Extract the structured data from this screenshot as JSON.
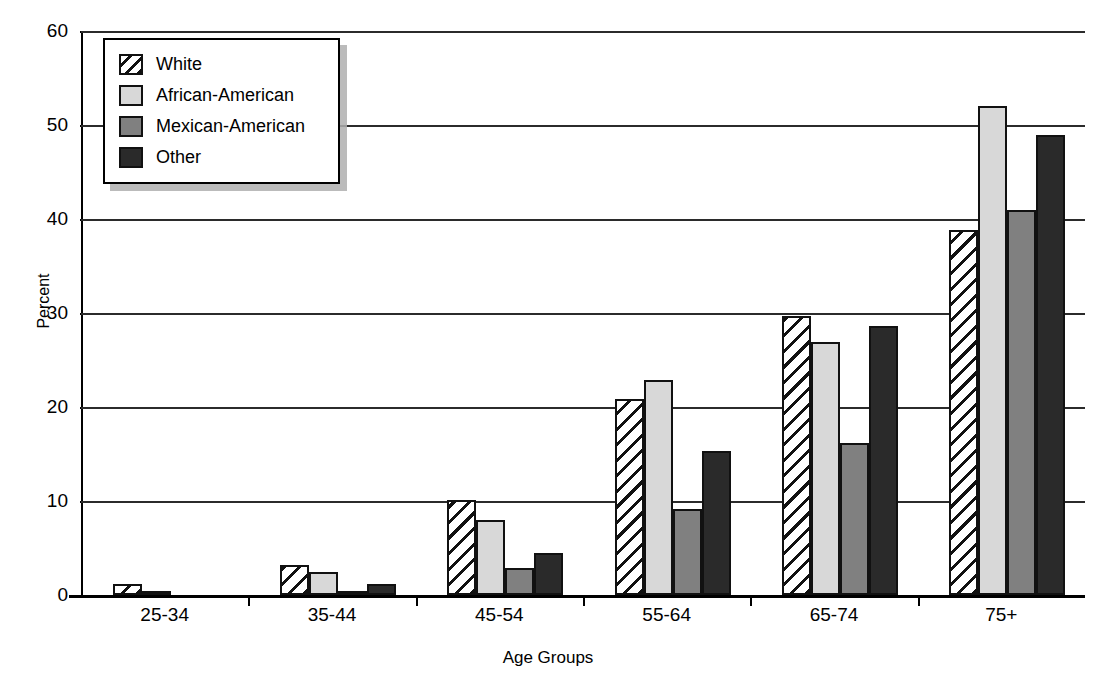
{
  "chart_data": {
    "type": "bar",
    "title": "",
    "xlabel": "Age Groups",
    "ylabel": "Percent",
    "categories": [
      "25-34",
      "35-44",
      "45-54",
      "55-64",
      "65-74",
      "75+"
    ],
    "series": [
      {
        "name": "White",
        "values": [
          1.2,
          3.2,
          10.1,
          20.9,
          29.7,
          38.8
        ],
        "color": "#ffffff",
        "pattern": "diagonal-hatch"
      },
      {
        "name": "African-American",
        "values": [
          0.3,
          2.4,
          8.0,
          22.9,
          26.9,
          52.0
        ],
        "color": "#d8d8d8",
        "pattern": "solid"
      },
      {
        "name": "Mexican-American",
        "values": [
          0.0,
          0.4,
          2.9,
          9.2,
          16.2,
          41.0
        ],
        "color": "#808080",
        "pattern": "solid"
      },
      {
        "name": "Other",
        "values": [
          0.0,
          1.2,
          4.5,
          15.3,
          28.6,
          48.9
        ],
        "color": "#2a2a2a",
        "pattern": "solid"
      }
    ],
    "ylim": [
      0,
      60
    ],
    "yticks": [
      0,
      10,
      20,
      30,
      40,
      50,
      60
    ],
    "ytick_labels": [
      "0",
      "10",
      "20",
      "30",
      "40",
      "50",
      "60"
    ],
    "grid": true,
    "grid_axis": "y",
    "legend_position": "top-left",
    "legend_entries": [
      "White",
      "African-American",
      "Mexican-American",
      "Other"
    ]
  }
}
